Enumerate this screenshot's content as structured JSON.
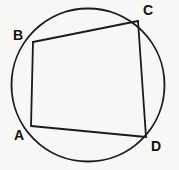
{
  "figure": {
    "background_color": "#f7f7f6",
    "stroke_color": "#1a1a1a",
    "label_color": "#121212",
    "circle": {
      "name": "circumscribed-circle",
      "cx": 88,
      "cy": 85,
      "r": 76.5,
      "stroke_width": 1.8,
      "fill": "none"
    },
    "vertices": [
      {
        "id": "A",
        "label": "A",
        "x": 31,
        "y": 126,
        "label_x": 14,
        "label_y": 128
      },
      {
        "id": "B",
        "label": "B",
        "x": 33,
        "y": 42,
        "label_x": 13,
        "label_y": 28
      },
      {
        "id": "C",
        "label": "C",
        "x": 138,
        "y": 21,
        "label_x": 143,
        "label_y": 3
      },
      {
        "id": "D",
        "label": "D",
        "x": 146,
        "y": 137,
        "label_x": 151,
        "label_y": 139
      }
    ],
    "edges": [
      {
        "id": "AB",
        "from": "A",
        "to": "B",
        "label": "side-AB",
        "x1": 31,
        "y1": 126,
        "x2": 33,
        "y2": 42
      },
      {
        "id": "BC",
        "from": "B",
        "to": "C",
        "label": "side-BC",
        "x1": 33,
        "y1": 42,
        "x2": 138,
        "y2": 21
      },
      {
        "id": "CD",
        "from": "C",
        "to": "D",
        "label": "side-CD",
        "x1": 138,
        "y1": 21,
        "x2": 146,
        "y2": 137
      },
      {
        "id": "DA",
        "from": "D",
        "to": "A",
        "label": "side-DA",
        "x1": 146,
        "y1": 137,
        "x2": 31,
        "y2": 126
      }
    ],
    "quadrilateral_points": "31,126 33,42 138,21 146,137",
    "edge_stroke_width": 1.8
  }
}
